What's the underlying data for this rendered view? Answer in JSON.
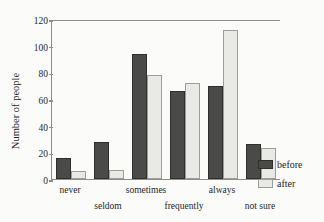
{
  "chart_data": {
    "type": "bar",
    "title": "",
    "xlabel": "",
    "ylabel": "Number of people",
    "categories": [
      "never",
      "seldom",
      "sometimes",
      "frequently",
      "always",
      "not sure"
    ],
    "series": [
      {
        "name": "before",
        "color": "#4a4a48",
        "values": [
          16,
          28,
          94,
          66,
          70,
          26
        ]
      },
      {
        "name": "after",
        "color": "#e9e9e6",
        "values": [
          6,
          7,
          78,
          72,
          112,
          23
        ]
      }
    ],
    "ylim": [
      0,
      120
    ],
    "yticks": [
      0,
      20,
      40,
      60,
      80,
      100,
      120
    ],
    "ytick_labels": [
      "0",
      "20",
      "40",
      "60",
      "80",
      "100",
      "120"
    ],
    "grid": false,
    "legend_position": "right",
    "xlabel_stagger": true
  },
  "axis": {
    "y_title": "Number of people"
  },
  "legend": {
    "entries": [
      {
        "label": "before"
      },
      {
        "label": "after"
      }
    ]
  }
}
